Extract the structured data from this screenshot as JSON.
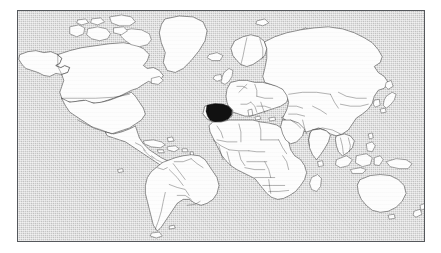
{
  "figure": {
    "type": "locator-map",
    "frame": {
      "x": 17,
      "y": 10,
      "width": 408,
      "height": 232,
      "border_color": "#55585c"
    },
    "canvas": {
      "width": 441,
      "height": 253,
      "background_color": "#ffffff"
    }
  },
  "colors": {
    "ocean": "#c8c8c8",
    "land": "#fdfdfd",
    "coastline": "#3b3b3b",
    "country_border": "#4a4a4a",
    "highlight": "#111111",
    "page_background": "#ffffff"
  },
  "projection": {
    "name": "equirectangular",
    "lon_range": [
      -180,
      180
    ],
    "lat_range": [
      -90,
      84
    ]
  },
  "highlight": {
    "country": "Spain",
    "region": "Iberian Peninsula",
    "continent": "Europe",
    "fill": "#111111",
    "pixel_bbox": [
      205,
      104,
      14,
      13
    ]
  },
  "labels": {
    "visible_text": []
  },
  "legend": {
    "present": false,
    "entries": []
  },
  "graticule": {
    "visible": false
  },
  "landmasses": [
    {
      "name": "North America",
      "highlighted": false
    },
    {
      "name": "South America",
      "highlighted": false
    },
    {
      "name": "Greenland",
      "highlighted": false
    },
    {
      "name": "Europe",
      "highlighted": true
    },
    {
      "name": "Africa",
      "highlighted": false
    },
    {
      "name": "Asia",
      "highlighted": false
    },
    {
      "name": "Australia",
      "highlighted": false
    },
    {
      "name": "New Zealand",
      "highlighted": false
    },
    {
      "name": "Indonesia",
      "highlighted": false
    },
    {
      "name": "Japan",
      "highlighted": false
    },
    {
      "name": "British Isles",
      "highlighted": false
    },
    {
      "name": "Iceland",
      "highlighted": false
    },
    {
      "name": "Madagascar",
      "highlighted": false
    },
    {
      "name": "Caribbean Islands",
      "highlighted": false
    },
    {
      "name": "Philippines",
      "highlighted": false
    },
    {
      "name": "Sri Lanka",
      "highlighted": false
    }
  ],
  "chart_data": {
    "type": "map",
    "xlabel": "",
    "ylabel": "",
    "categories": [
      "Spain"
    ],
    "values": [
      1
    ],
    "series": [
      {
        "name": "Highlighted country",
        "values": [
          "Spain"
        ]
      }
    ]
  }
}
